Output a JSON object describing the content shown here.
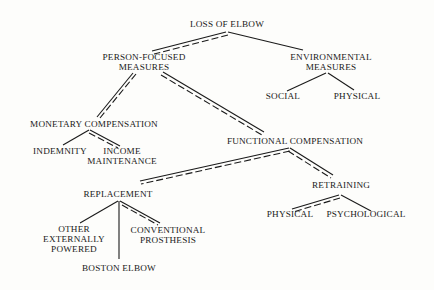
{
  "diagram": {
    "title": "LOSS OF ELBOW",
    "nodes": {
      "root": {
        "lines": [
          "LOSS OF ELBOW"
        ]
      },
      "person": {
        "lines": [
          "PERSON-FOCUSED",
          "MEASURES"
        ]
      },
      "environmental": {
        "lines": [
          "ENVIRONMENTAL",
          "MEASURES"
        ]
      },
      "social": {
        "lines": [
          "SOCIAL"
        ]
      },
      "env_physical": {
        "lines": [
          "PHYSICAL"
        ]
      },
      "monetary": {
        "lines": [
          "MONETARY COMPENSATION"
        ]
      },
      "indemnity": {
        "lines": [
          "INDEMNITY"
        ]
      },
      "income": {
        "lines": [
          "INCOME",
          "MAINTENANCE"
        ]
      },
      "functional": {
        "lines": [
          "FUNCTIONAL COMPENSATION"
        ]
      },
      "replacement": {
        "lines": [
          "REPLACEMENT"
        ]
      },
      "other": {
        "lines": [
          "OTHER",
          "EXTERNALLY",
          "POWERED"
        ]
      },
      "conventional": {
        "lines": [
          "CONVENTIONAL",
          "PROSTHESIS"
        ]
      },
      "boston": {
        "lines": [
          "BOSTON ELBOW"
        ]
      },
      "retraining": {
        "lines": [
          "RETRAINING"
        ]
      },
      "ret_physical": {
        "lines": [
          "PHYSICAL"
        ]
      },
      "psychological": {
        "lines": [
          "PSYCHOLOGICAL"
        ]
      }
    },
    "edges": [
      {
        "from": "root",
        "to": "person",
        "style": "double"
      },
      {
        "from": "root",
        "to": "environmental",
        "style": "single"
      },
      {
        "from": "environmental",
        "to": "social",
        "style": "single"
      },
      {
        "from": "environmental",
        "to": "env_physical",
        "style": "single"
      },
      {
        "from": "person",
        "to": "monetary",
        "style": "double"
      },
      {
        "from": "person",
        "to": "functional",
        "style": "double"
      },
      {
        "from": "monetary",
        "to": "indemnity",
        "style": "single"
      },
      {
        "from": "monetary",
        "to": "income",
        "style": "double"
      },
      {
        "from": "functional",
        "to": "replacement",
        "style": "double"
      },
      {
        "from": "functional",
        "to": "retraining",
        "style": "double"
      },
      {
        "from": "replacement",
        "to": "other",
        "style": "single"
      },
      {
        "from": "replacement",
        "to": "boston",
        "style": "single"
      },
      {
        "from": "replacement",
        "to": "conventional",
        "style": "double"
      },
      {
        "from": "retraining",
        "to": "ret_physical",
        "style": "double"
      },
      {
        "from": "retraining",
        "to": "psychological",
        "style": "single"
      }
    ],
    "colors": {
      "ink": "#1a1a1a",
      "paper": "#fdfdfb"
    }
  }
}
